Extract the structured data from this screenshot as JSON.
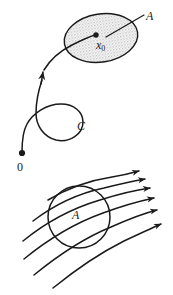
{
  "figure": {
    "background_color": "#ffffff",
    "ink_color": "#1a1a1a",
    "stipple_fill_color": "#c9c9c9",
    "width": 173,
    "height": 295
  },
  "labels": {
    "set_A_top": "A",
    "point_x0": "x",
    "point_x0_subscript": "0",
    "curve_C": "C",
    "origin": "0",
    "set_A_bottom": "A"
  },
  "top_panel": {
    "region": {
      "name": "A",
      "shape": "ellipse",
      "center": [
        101,
        38
      ],
      "radius_x": 37,
      "radius_y": 24,
      "rotation_deg": -9,
      "fill": "stippled-gray",
      "stroke": "#1a1a1a"
    },
    "marked_point": {
      "name": "x0",
      "position": [
        96,
        35
      ],
      "style": "filled-dot"
    },
    "leader_line": {
      "name": "A-leader",
      "from": [
        144,
        14
      ],
      "to": [
        107,
        37
      ]
    },
    "trajectory": {
      "name": "C",
      "start_point": [
        22,
        154
      ],
      "start_marker": "filled-dot",
      "has_loop": true,
      "arrow_position": [
        41,
        74
      ],
      "arrow_direction_deg": -62,
      "end_point": [
        96,
        35
      ]
    }
  },
  "bottom_panel": {
    "region": {
      "name": "A",
      "shape": "ellipse",
      "center": [
        79,
        217
      ],
      "radius_x": 31,
      "radius_y": 31,
      "rotation_deg": 0,
      "fill": "none",
      "stroke": "#1a1a1a"
    },
    "flow": {
      "name": "vector-field-streamlines",
      "streamline_count": 6,
      "arrowheads": 6,
      "direction": "left-to-right, curving upward"
    }
  }
}
